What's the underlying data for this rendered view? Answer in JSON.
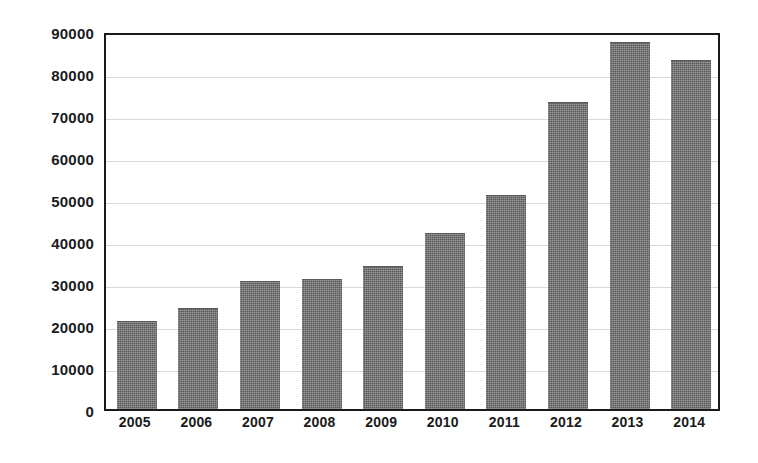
{
  "chart_data": {
    "type": "bar",
    "title": "",
    "subtitle": "",
    "xlabel": "",
    "ylabel": "",
    "categories": [
      "2005",
      "2006",
      "2007",
      "2008",
      "2009",
      "2010",
      "2011",
      "2012",
      "2013",
      "2014"
    ],
    "values": [
      21000,
      24000,
      30500,
      31000,
      34000,
      42000,
      51000,
      73000,
      87500,
      83000
    ],
    "series": [
      {
        "name": "",
        "values": [
          21000,
          24000,
          30500,
          31000,
          34000,
          42000,
          51000,
          73000,
          87500,
          83000
        ]
      }
    ],
    "ylim": [
      0,
      90000
    ],
    "ytick_values": [
      0,
      10000,
      20000,
      30000,
      40000,
      50000,
      60000,
      70000,
      80000,
      90000
    ],
    "ytick_labels": [
      "0",
      "10000",
      "20000",
      "30000",
      "40000",
      "50000",
      "60000",
      "70000",
      "80000",
      "90000"
    ],
    "grid": true,
    "grid_axis": "y",
    "legend": false,
    "legend_position": "none",
    "annotations": [],
    "colors": {
      "bar_fill": "#6d6d6d",
      "axis_line": "#1a1a1a",
      "gridline": "#d9d9d9",
      "text": "#1b1b1b",
      "background": "#ffffff"
    }
  }
}
